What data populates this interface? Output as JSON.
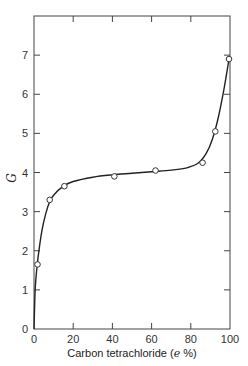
{
  "chart_data": {
    "type": "line",
    "title": "",
    "xlabel": "Carbon tetrachloride (e %)",
    "xlabel_parts": {
      "prefix": "Carbon tetrachloride (",
      "italic": "e",
      "suffix": " %)"
    },
    "ylabel": "G",
    "xlim": [
      0,
      100
    ],
    "ylim": [
      0,
      8
    ],
    "x_ticks": [
      0,
      20,
      40,
      60,
      80,
      100
    ],
    "y_ticks": [
      0,
      1,
      2,
      3,
      4,
      5,
      6,
      7
    ],
    "grid": false,
    "legend": null,
    "series": [
      {
        "name": "G vs carbon tetrachloride",
        "markers": "open-circle",
        "x": [
          1.8,
          8,
          15.5,
          41,
          62,
          86,
          92.5,
          99.5
        ],
        "y": [
          1.65,
          3.3,
          3.65,
          3.9,
          4.05,
          4.25,
          5.05,
          6.9
        ]
      }
    ],
    "curve": {
      "description": "smooth fitted curve through origin rising steeply, plateau near G=4, then sharp rise near 100%",
      "x": [
        0,
        0.5,
        1,
        2,
        4,
        6,
        8,
        10,
        15,
        20,
        30,
        40,
        50,
        60,
        70,
        78,
        84,
        88,
        91,
        94,
        97,
        99.5
      ],
      "y": [
        0,
        0.9,
        1.3,
        1.8,
        2.5,
        2.95,
        3.25,
        3.42,
        3.65,
        3.77,
        3.88,
        3.94,
        3.98,
        4.02,
        4.06,
        4.12,
        4.25,
        4.5,
        4.85,
        5.4,
        6.15,
        6.9
      ]
    }
  }
}
